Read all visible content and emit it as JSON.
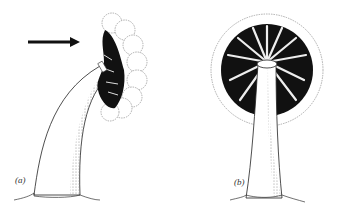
{
  "figure": {
    "panels": [
      {
        "id": "a",
        "label": "(a)",
        "description": "side view of stalked organism with lobed crown; arrow points to crown"
      },
      {
        "id": "b",
        "label": "(b)",
        "description": "front view of stalked organism with radially striped circular crown"
      }
    ],
    "arrow": {
      "direction": "right",
      "points_to": "crown of panel a"
    },
    "colors": {
      "ink": "#111111",
      "background": "#ffffff",
      "stipple": "#888888"
    }
  }
}
